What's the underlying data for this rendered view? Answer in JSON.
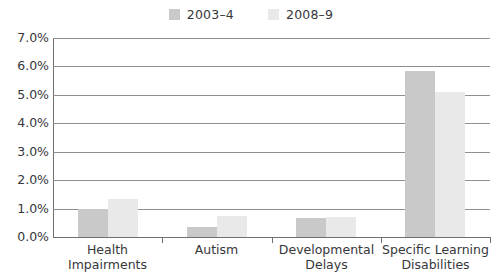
{
  "legend": {
    "position": "top-center",
    "entries": [
      {
        "label": "2003–4",
        "color": "#c9c9c9",
        "icon": "square-swatch-icon"
      },
      {
        "label": "2008–9",
        "color": "#e9e9e9",
        "icon": "square-swatch-icon"
      }
    ]
  },
  "axes": {
    "y_ticks": [
      "7.0%",
      "6.0%",
      "5.0%",
      "4.0%",
      "3.0%",
      "2.0%",
      "1.0%",
      "0.0%"
    ],
    "x_categories": [
      {
        "line1": "Health",
        "line2": "Impairments"
      },
      {
        "line1": "Autism",
        "line2": ""
      },
      {
        "line1": "Developmental",
        "line2": "Delays"
      },
      {
        "line1": "Specific Learning",
        "line2": "Disabilities"
      }
    ]
  },
  "chart_data": {
    "type": "bar",
    "title": "",
    "subtitle": "",
    "xlabel": "",
    "ylabel": "",
    "ylim": [
      0,
      7
    ],
    "ytick_step": 1,
    "ytick_suffix": "%",
    "grid": true,
    "legend_position": "top-center",
    "categories": [
      "Health Impairments",
      "Autism",
      "Developmental Delays",
      "Specific Learning Disabilities"
    ],
    "series": [
      {
        "name": "2003–4",
        "color": "#c9c9c9",
        "values": [
          1.0,
          0.35,
          0.68,
          5.85
        ]
      },
      {
        "name": "2008–9",
        "color": "#e9e9e9",
        "values": [
          1.35,
          0.75,
          0.72,
          5.1
        ]
      }
    ]
  },
  "style": {
    "axis_color": "#6f6f6f",
    "grid_color": "#8e8e8e",
    "text_color": "#37373a",
    "background": "#ffffff"
  }
}
